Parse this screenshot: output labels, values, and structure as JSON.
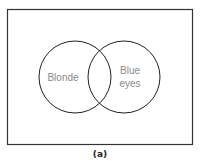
{
  "diagram": {
    "type": "venn",
    "sets": [
      {
        "id": "A",
        "label_lines": [
          "Blonde"
        ]
      },
      {
        "id": "B",
        "label_lines": [
          "Blue",
          "eyes"
        ]
      }
    ],
    "caption": "(a)",
    "colors": {
      "frame": "#333333",
      "circle_stroke": "#222222",
      "label": "#8a8a8a",
      "caption": "#222222"
    }
  }
}
